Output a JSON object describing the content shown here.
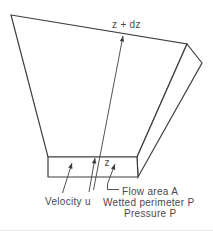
{
  "figure": {
    "background": "#ffffff",
    "line_color": "#3e3e3e",
    "text_color": "#4a4a4a",
    "labels": {
      "elevation_top": "z + dz",
      "elevation_bottom": "z",
      "velocity": "Velocity u",
      "flow_area": "Flow area A",
      "wetted_perimeter": "Wetted perimeter P",
      "pressure": "Pressure P"
    }
  }
}
